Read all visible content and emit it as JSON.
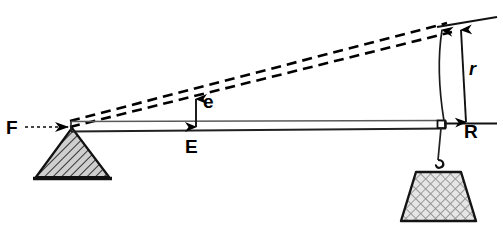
{
  "figure": {
    "type": "mechanics-diagram",
    "background_color": "#ffffff",
    "ink_color": "#000000"
  },
  "labels": {
    "force": "F",
    "effort_small": "e",
    "effort_large": "E",
    "resistance": "R",
    "radius": "r"
  },
  "elements": {
    "fulcrum": {
      "name": "fulcrum-triangle",
      "fill": "#b8b8b8",
      "hatch": "diagonal-45"
    },
    "load": {
      "name": "load-weight-trapezoid",
      "fill": "#d6d6d6",
      "hatch": "cross-hatch"
    },
    "beam": {
      "name": "lever-beam",
      "stroke": "#555555"
    },
    "dashed_rays": {
      "name": "displaced-lever-dashed",
      "count": 2,
      "stroke": "#000000",
      "dash": "9 6"
    },
    "arc": {
      "name": "swing-arc",
      "stroke": "#000000"
    }
  },
  "geometry": {
    "pivot": {
      "x": 72,
      "y": 127
    },
    "beam_end": {
      "x": 444,
      "y": 124
    },
    "ray_top_end": {
      "x": 447,
      "y": 23
    },
    "ray_bottom_end": {
      "x": 452,
      "y": 31
    },
    "r_arrow_top": {
      "x": 466,
      "y": 28
    },
    "r_arrow_bottom": {
      "x": 458,
      "y": 122
    },
    "e_arrow_top": {
      "x": 196,
      "y": 98
    },
    "e_arrow_bottom": {
      "x": 196,
      "y": 128
    }
  }
}
